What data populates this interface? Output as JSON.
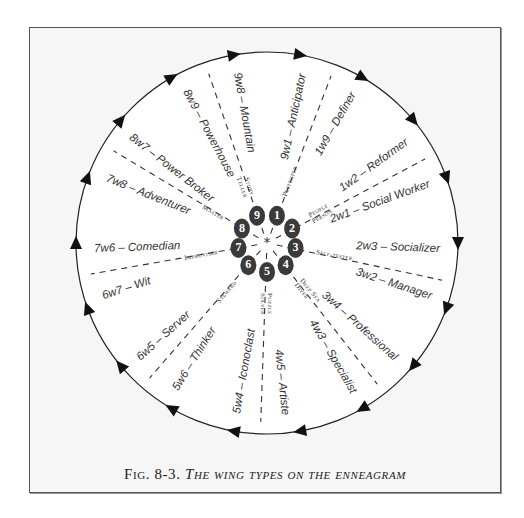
{
  "figure": {
    "caption_prefix": "Fig. 8-3.",
    "caption_title": "The wing types on the enneagram",
    "colors": {
      "line": "#222222",
      "background": "#f6f6f6",
      "badge": "#3a3a3a"
    },
    "center": {
      "x": 267,
      "y": 243
    },
    "radius": 191,
    "arrow_count": 18
  },
  "center_symbol": "*",
  "types": [
    {
      "number": "1",
      "role": "Perfecter",
      "angle": -70
    },
    {
      "number": "2",
      "role": "People Person",
      "angle": -30
    },
    {
      "number": "3",
      "role": "Self-tester",
      "angle": 10
    },
    {
      "number": "4",
      "role": "Deep Sea Diver",
      "angle": 50
    },
    {
      "number": "5",
      "role": "Puzzle Solver",
      "angle": 90
    },
    {
      "number": "6",
      "role": "Steward",
      "angle": 130
    },
    {
      "number": "7",
      "role": "Improviser",
      "angle": 170
    },
    {
      "number": "8",
      "role": "Master",
      "angle": -150
    },
    {
      "number": "9",
      "role": "Story Teller",
      "angle": -110
    }
  ],
  "wings": [
    {
      "label": "9w1 – Anticipator",
      "angle": -78
    },
    {
      "label": "1w9 – Definer",
      "angle": -60
    },
    {
      "label": "1w2 – Reformer",
      "angle": -36
    },
    {
      "label": "2w1 – Social Worker",
      "angle": -20
    },
    {
      "label": "2w3 – Socializer",
      "angle": 2
    },
    {
      "label": "3w2 – Manager",
      "angle": 18
    },
    {
      "label": "3w4 – Professional",
      "angle": 42
    },
    {
      "label": "4w3 – Specialist",
      "angle": 60
    },
    {
      "label": "4w5 – Artiste",
      "angle": 84
    },
    {
      "label": "5w4 – Iconoclast",
      "angle": 100
    },
    {
      "label": "5w6 – Thinker",
      "angle": 122
    },
    {
      "label": "6w5 – Server",
      "angle": 138
    },
    {
      "label": "6w7 – Wit",
      "angle": 162
    },
    {
      "label": "7w6 – Comedian",
      "angle": 178
    },
    {
      "label": "7w8 – Adventurer",
      "angle": -158
    },
    {
      "label": "8w7 – Power Broker",
      "angle": -142
    },
    {
      "label": "8w9 – Powerhouse",
      "angle": -118
    },
    {
      "label": "9w8 – Mountain",
      "angle": -100
    }
  ],
  "divider_angles": [
    -69,
    -28,
    12,
    52,
    92,
    131,
    170,
    -149,
    -109
  ]
}
